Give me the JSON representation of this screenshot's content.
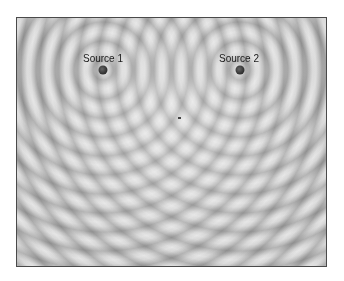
{
  "figure": {
    "sources": [
      {
        "label": "Source 1",
        "x": 102,
        "y": 69
      },
      {
        "label": "Source 2",
        "x": 239,
        "y": 69
      }
    ],
    "colors": {
      "frame_border": "#4a4a4a",
      "background": "#e6e6e6",
      "wave_trough": "#c9c9c9",
      "source_dot": "#333333",
      "label_text": "#1a1a1a"
    }
  }
}
